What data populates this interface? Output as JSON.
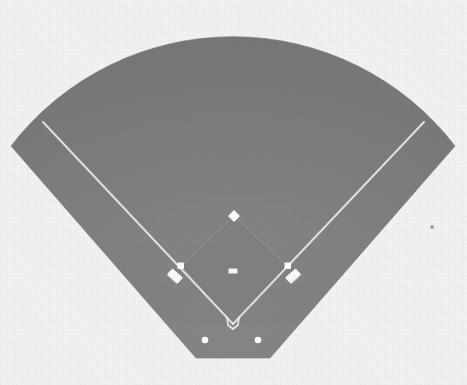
{
  "diagram": {
    "title": "Baseball Field Overhead Diagram",
    "type": "baseball-field-plan",
    "rendering": "grayscale scanned illustration",
    "canvas": {
      "width": 467,
      "height": 385
    },
    "colors": {
      "background": "#f1f1f0",
      "fair_territory_turf": "#7d7d7d",
      "outfield_turf": "#787878",
      "infield_dirt": "#818181",
      "foul_line": "#e8e8e6",
      "base_white": "#fafafa",
      "plate_white": "#f0f0ee",
      "speck": "#6f6f6f"
    },
    "geometry": {
      "home_plate": {
        "x": 233,
        "y": 324,
        "label": "Home Plate"
      },
      "apex_angle_degrees": 90,
      "outfield_arc_top_y": 45,
      "outfield_arc_radius": 280,
      "left_field_corner": {
        "x": 11,
        "y": 146
      },
      "right_field_corner": {
        "x": 455,
        "y": 146
      },
      "bottom_edge_y": 358,
      "bottom_left": {
        "x": 196,
        "y": 358
      },
      "bottom_right": {
        "x": 270,
        "y": 358
      }
    },
    "elements": {
      "second_base": {
        "x": 234,
        "y": 216,
        "label": "Second Base",
        "shape": "diamond"
      },
      "pitchers_rubber": {
        "x": 233,
        "y": 271,
        "label": "Pitcher's Rubber",
        "shape": "rectangle"
      },
      "first_base": {
        "x": 288,
        "y": 266,
        "label": "First Base",
        "shape": "square"
      },
      "third_base": {
        "x": 181,
        "y": 266,
        "label": "Third Base",
        "shape": "square"
      },
      "first_base_coach_box": {
        "x": 292,
        "y": 278,
        "label": "First Base Coach's Box"
      },
      "third_base_coach_box": {
        "x": 177,
        "y": 278,
        "label": "Third Base Coach's Box"
      },
      "left_on_deck_circle": {
        "x": 205,
        "y": 340,
        "label": "Left On-Deck Circle"
      },
      "right_on_deck_circle": {
        "x": 258,
        "y": 340,
        "label": "Right On-Deck Circle"
      },
      "left_foul_line": {
        "from": "home-plate",
        "to": "left-field-corner",
        "label": "Left Field Foul Line"
      },
      "right_foul_line": {
        "from": "home-plate",
        "to": "right-field-corner",
        "label": "Right Field Foul Line"
      },
      "infield_dirt_arc": {
        "center_x": 233,
        "center_y": 324,
        "radius": 128,
        "label": "Infield Dirt Arc"
      },
      "scan_speck": {
        "x": 432,
        "y": 227,
        "label": "Scan Artifact Speck"
      }
    }
  }
}
